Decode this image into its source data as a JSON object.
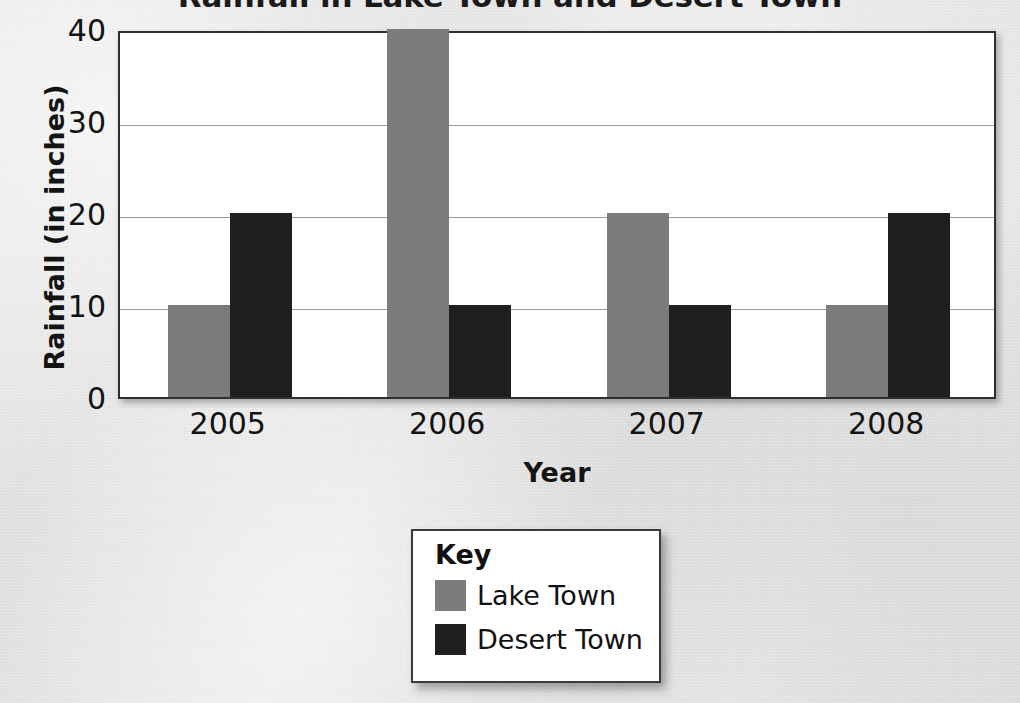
{
  "chart_data": {
    "type": "bar",
    "title": "Rainfall in Lake Town and Desert Town",
    "xlabel": "Year",
    "ylabel": "Rainfall (in inches)",
    "categories": [
      "2005",
      "2006",
      "2007",
      "2008"
    ],
    "series": [
      {
        "name": "Lake Town",
        "color": "#7b7b7b",
        "values": [
          10,
          40,
          20,
          10
        ]
      },
      {
        "name": "Desert Town",
        "color": "#1f1f1f",
        "values": [
          20,
          10,
          10,
          20
        ]
      }
    ],
    "ylim": [
      0,
      40
    ],
    "yticks": [
      0,
      10,
      20,
      30,
      40
    ],
    "ytick_labels": [
      "0",
      "10",
      "20",
      "30",
      "40"
    ],
    "grid": true,
    "legend_position": "below-center",
    "legend_title": "Key"
  },
  "legend": {
    "title": "Key",
    "entries": [
      {
        "label": "Lake Town",
        "color": "#7b7b7b"
      },
      {
        "label": "Desert Town",
        "color": "#1f1f1f"
      }
    ]
  },
  "axes": {
    "y_title": "Rainfall (in inches)",
    "x_title": "Year"
  }
}
